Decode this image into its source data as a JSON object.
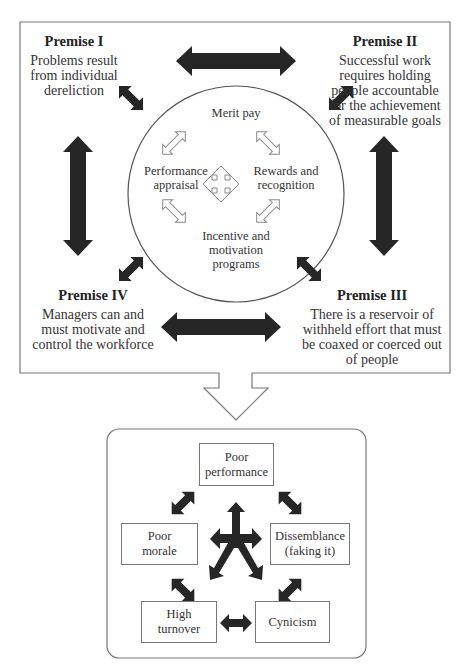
{
  "premises": [
    {
      "heading": "Premise I",
      "lines": [
        "Problems result",
        "from individual",
        "dereliction"
      ]
    },
    {
      "heading": "Premise II",
      "lines": [
        "Successful work",
        "requires holding",
        "people accountable",
        "for the achievement",
        "of measurable goals"
      ]
    },
    {
      "heading": "Premise III",
      "lines": [
        "There is a reservoir of",
        "withheld effort that must",
        "be coaxed or coerced out",
        "of people"
      ]
    },
    {
      "heading": "Premise IV",
      "lines": [
        "Managers can and",
        "must motivate and",
        "control the workforce"
      ]
    }
  ],
  "circle": {
    "top": "Merit pay",
    "left": [
      "Performance",
      "appraisal"
    ],
    "right": [
      "Rewards and",
      "recognition"
    ],
    "bottom": [
      "Incentive and",
      "motivation",
      "programs"
    ]
  },
  "outcomes": {
    "top": [
      "Poor",
      "performance"
    ],
    "left": [
      "Poor",
      "morale"
    ],
    "right": [
      "Dissemblance",
      "(faking it)"
    ],
    "bottom_left": [
      "High",
      "turnover"
    ],
    "bottom_right": [
      "Cynicism"
    ]
  },
  "colors": {
    "arrow_fill": "#262626",
    "line": "#6e6e6e",
    "outline_arrow": "#8a8a8a"
  }
}
